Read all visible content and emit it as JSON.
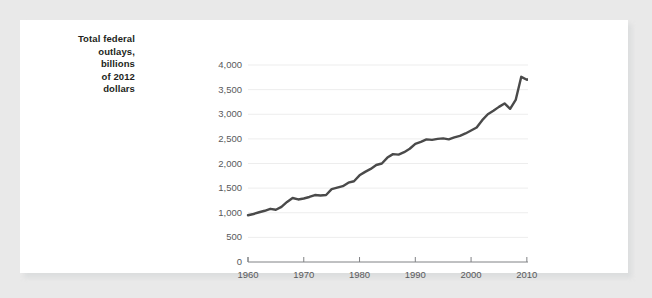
{
  "chart_data": {
    "type": "line",
    "title": "",
    "subtitle": "",
    "ylabel": "Total federal outlays, billions of 2012 dollars",
    "ylabel_lines": [
      "Total federal",
      "outlays,",
      "billions",
      "of 2012",
      "dollars"
    ],
    "xlabel": "",
    "grid": true,
    "legend_position": "none",
    "line_color": "#4a4a4a",
    "gridline_color": "#ededed",
    "axis_color": "#808285",
    "tick_label_color": "#58595b",
    "xlim": [
      1960,
      2013
    ],
    "ylim": [
      0,
      4000
    ],
    "ytick_labels": [
      "4,000",
      "3,500",
      "3,000",
      "2,500",
      "2,000",
      "1,500",
      "1,000",
      "500",
      "0"
    ],
    "ytick_values": [
      4000,
      3500,
      3000,
      2500,
      2000,
      1500,
      1000,
      500,
      0
    ],
    "xtick_labels": [
      "1960",
      "1970",
      "1980",
      "1990",
      "2000",
      "2010"
    ],
    "xtick_values": [
      1960,
      1970,
      1980,
      1990,
      2000,
      2010
    ],
    "x": [
      1960,
      1961,
      1962,
      1963,
      1964,
      1965,
      1966,
      1967,
      1968,
      1969,
      1970,
      1971,
      1972,
      1973,
      1974,
      1975,
      1976,
      1977,
      1978,
      1979,
      1980,
      1981,
      1982,
      1983,
      1984,
      1985,
      1986,
      1987,
      1988,
      1989,
      1990,
      1991,
      1992,
      1993,
      1994,
      1995,
      1996,
      1997,
      1998,
      1999,
      2000,
      2001,
      2002,
      2003,
      2004,
      2005,
      2006,
      2007,
      2008,
      2009,
      2010,
      2011,
      2012
    ],
    "values": [
      950,
      975,
      1010,
      1040,
      1080,
      1060,
      1120,
      1220,
      1300,
      1270,
      1290,
      1320,
      1360,
      1350,
      1360,
      1480,
      1510,
      1540,
      1610,
      1640,
      1760,
      1830,
      1890,
      1970,
      2000,
      2120,
      2190,
      2180,
      2230,
      2300,
      2400,
      2440,
      2490,
      2480,
      2500,
      2510,
      2490,
      2530,
      2560,
      2610,
      2670,
      2730,
      2880,
      3000,
      3070,
      3150,
      3220,
      3110,
      3290,
      3760,
      3700,
      3740,
      3560
    ],
    "series": [
      {
        "name": "Total federal outlays",
        "units": "billions of 2012 dollars",
        "values": [
          950,
          975,
          1010,
          1040,
          1080,
          1060,
          1120,
          1220,
          1300,
          1270,
          1290,
          1320,
          1360,
          1350,
          1360,
          1480,
          1510,
          1540,
          1610,
          1640,
          1760,
          1830,
          1890,
          1970,
          2000,
          2120,
          2190,
          2180,
          2230,
          2300,
          2400,
          2440,
          2490,
          2480,
          2500,
          2510,
          2490,
          2530,
          2560,
          2610,
          2670,
          2730,
          2880,
          3000,
          3070,
          3150,
          3220,
          3110,
          3290,
          3760,
          3700,
          3740,
          3560
        ]
      }
    ]
  }
}
